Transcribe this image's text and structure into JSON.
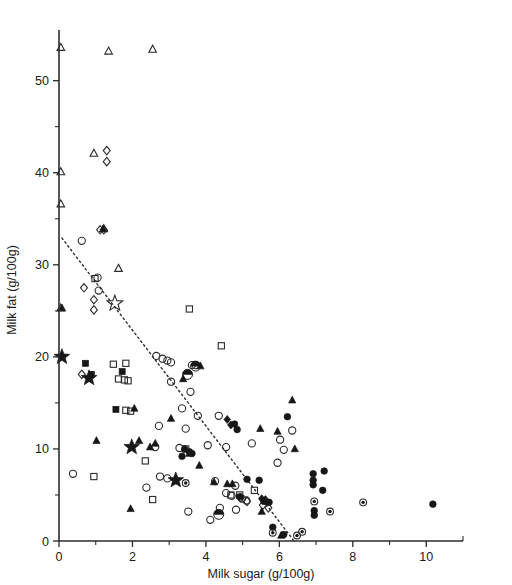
{
  "figure": {
    "background": "#ffffff",
    "ink_color": "#1a1a1a",
    "marker_color": "#171717"
  },
  "chart_data": {
    "type": "scatter",
    "title": "",
    "subtitle": "",
    "xlabel": "Milk sugar (g/100g)",
    "ylabel": "Milk fat (g/100g)",
    "xlim": [
      0,
      11.0
    ],
    "ylim": [
      0,
      55.5
    ],
    "xticks": [
      0,
      2,
      4,
      6,
      8,
      10
    ],
    "xticklabels": [
      "0",
      "2",
      "4",
      "6",
      "8",
      "10"
    ],
    "xminorticks": [
      1,
      3,
      5,
      7,
      9
    ],
    "yticks": [
      0,
      10,
      20,
      30,
      40,
      50
    ],
    "yticklabels": [
      "0",
      "10",
      "20",
      "30",
      "40",
      "50"
    ],
    "yminorticks": [
      5,
      15,
      25,
      35,
      45
    ],
    "grid": false,
    "legend": "none",
    "annotations": [],
    "trendline": {
      "style": "dotted",
      "x": [
        0.08,
        6.4
      ],
      "y": [
        32.9,
        0.0
      ]
    },
    "series": [
      {
        "name": "open-triangle",
        "marker": "triangle-open",
        "points": [
          [
            0.05,
            53.6
          ],
          [
            1.35,
            53.2
          ],
          [
            2.55,
            53.4
          ],
          [
            0.95,
            42.1
          ],
          [
            0.05,
            40.1
          ],
          [
            0.05,
            36.6
          ],
          [
            1.22,
            33.9
          ],
          [
            1.62,
            29.6
          ],
          [
            0.05,
            25.3
          ]
        ]
      },
      {
        "name": "open-diamond",
        "marker": "diamond-open",
        "points": [
          [
            1.3,
            42.4
          ],
          [
            1.3,
            41.2
          ],
          [
            1.12,
            33.8
          ],
          [
            1.22,
            33.8
          ],
          [
            0.68,
            27.5
          ],
          [
            0.95,
            26.2
          ],
          [
            0.95,
            25.1
          ],
          [
            0.62,
            18.1
          ],
          [
            4.95,
            4.7
          ],
          [
            5.12,
            4.3
          ],
          [
            5.55,
            3.9
          ],
          [
            5.7,
            3.6
          ]
        ]
      },
      {
        "name": "open-circle",
        "marker": "circle-open",
        "points": [
          [
            0.62,
            32.6
          ],
          [
            1.05,
            28.6
          ],
          [
            1.08,
            27.2
          ],
          [
            2.65,
            20.1
          ],
          [
            2.82,
            19.8
          ],
          [
            2.95,
            19.6
          ],
          [
            3.05,
            19.4
          ],
          [
            3.62,
            19.1
          ],
          [
            3.72,
            19.1
          ],
          [
            3.05,
            17.3
          ],
          [
            3.58,
            16.2
          ],
          [
            3.35,
            14.4
          ],
          [
            3.78,
            13.6
          ],
          [
            4.35,
            13.6
          ],
          [
            2.72,
            12.5
          ],
          [
            3.45,
            12.2
          ],
          [
            2.62,
            10.2
          ],
          [
            3.28,
            10.1
          ],
          [
            4.05,
            10.4
          ],
          [
            4.55,
            10.2
          ],
          [
            5.25,
            10.6
          ],
          [
            0.38,
            7.3
          ],
          [
            2.75,
            7.0
          ],
          [
            2.95,
            6.8
          ],
          [
            4.25,
            6.5
          ],
          [
            4.8,
            6.0
          ],
          [
            4.55,
            5.2
          ],
          [
            4.7,
            4.9
          ],
          [
            4.98,
            4.6
          ],
          [
            5.1,
            4.4
          ],
          [
            4.38,
            3.6
          ],
          [
            4.82,
            3.4
          ],
          [
            3.52,
            3.2
          ],
          [
            4.12,
            2.3
          ],
          [
            2.38,
            5.8
          ],
          [
            6.35,
            12.0
          ],
          [
            6.02,
            11.0
          ],
          [
            5.95,
            8.5
          ],
          [
            6.12,
            9.9
          ]
        ]
      },
      {
        "name": "open-square",
        "marker": "square-open",
        "points": [
          [
            0.98,
            28.5
          ],
          [
            3.55,
            25.2
          ],
          [
            1.48,
            19.2
          ],
          [
            1.82,
            19.3
          ],
          [
            1.62,
            17.6
          ],
          [
            1.78,
            17.5
          ],
          [
            1.88,
            17.4
          ],
          [
            1.82,
            14.2
          ],
          [
            1.95,
            14.1
          ],
          [
            4.42,
            21.2
          ],
          [
            2.35,
            8.7
          ],
          [
            0.95,
            7.0
          ],
          [
            2.55,
            4.5
          ],
          [
            4.68,
            5.0
          ],
          [
            4.92,
            5.0
          ],
          [
            5.32,
            5.5
          ],
          [
            3.45,
            10.0
          ]
        ]
      },
      {
        "name": "filled-square",
        "marker": "square-filled",
        "points": [
          [
            0.72,
            19.3
          ],
          [
            0.88,
            18.1
          ],
          [
            1.72,
            18.4
          ],
          [
            1.55,
            14.3
          ]
        ]
      },
      {
        "name": "filled-triangle",
        "marker": "triangle-filled",
        "points": [
          [
            1.2,
            33.9
          ],
          [
            0.08,
            25.3
          ],
          [
            3.85,
            19.0
          ],
          [
            3.38,
            17.6
          ],
          [
            2.05,
            14.4
          ],
          [
            3.05,
            13.3
          ],
          [
            1.02,
            10.9
          ],
          [
            2.18,
            10.9
          ],
          [
            2.62,
            10.6
          ],
          [
            2.48,
            10.2
          ],
          [
            3.55,
            9.5
          ],
          [
            3.82,
            8.2
          ],
          [
            3.18,
            6.5
          ],
          [
            4.22,
            6.4
          ],
          [
            4.58,
            6.2
          ],
          [
            4.72,
            6.2
          ],
          [
            6.35,
            15.3
          ],
          [
            5.48,
            12.2
          ],
          [
            5.95,
            11.9
          ],
          [
            6.42,
            10.0
          ],
          [
            5.52,
            3.2
          ],
          [
            1.95,
            3.5
          ],
          [
            6.05,
            0.6
          ]
        ]
      },
      {
        "name": "filled-circle",
        "marker": "circle-filled",
        "points": [
          [
            6.22,
            13.5
          ],
          [
            4.78,
            12.7
          ],
          [
            4.85,
            12.1
          ],
          [
            3.42,
            10.0
          ],
          [
            3.55,
            9.7
          ],
          [
            3.62,
            9.5
          ],
          [
            3.35,
            9.2
          ],
          [
            5.12,
            6.7
          ],
          [
            5.45,
            6.6
          ],
          [
            4.92,
            4.8
          ],
          [
            5.58,
            4.3
          ],
          [
            5.72,
            4.2
          ],
          [
            6.92,
            7.3
          ],
          [
            7.22,
            7.6
          ],
          [
            6.92,
            6.6
          ],
          [
            6.92,
            6.1
          ],
          [
            7.18,
            5.5
          ],
          [
            6.95,
            3.3
          ],
          [
            6.95,
            2.8
          ],
          [
            10.18,
            4.0
          ],
          [
            6.12,
            0.7
          ],
          [
            5.82,
            1.5
          ]
        ]
      },
      {
        "name": "filled-diamond",
        "marker": "diamond-filled",
        "points": [
          [
            4.58,
            13.2
          ],
          [
            4.68,
            12.6
          ],
          [
            5.52,
            4.6
          ],
          [
            5.62,
            4.5
          ]
        ]
      },
      {
        "name": "big-star-filled",
        "marker": "star-filled",
        "points": [
          [
            0.08,
            20.0
          ],
          [
            0.82,
            17.7
          ],
          [
            1.98,
            10.2
          ],
          [
            3.18,
            6.6
          ]
        ]
      },
      {
        "name": "big-star-open",
        "marker": "star-open",
        "points": [
          [
            1.52,
            25.8
          ]
        ]
      },
      {
        "name": "half-filled-circle",
        "marker": "circle-half",
        "points": [
          [
            3.72,
            19.0
          ],
          [
            3.5,
            18.1
          ],
          [
            4.35,
            2.9
          ]
        ]
      },
      {
        "name": "dot-in-circle",
        "marker": "circle-dotted-center",
        "points": [
          [
            3.45,
            6.3
          ],
          [
            5.82,
            0.9
          ],
          [
            6.62,
            1.0
          ],
          [
            7.38,
            3.2
          ],
          [
            8.28,
            4.2
          ],
          [
            6.95,
            4.3
          ],
          [
            6.48,
            0.6
          ]
        ]
      }
    ]
  }
}
